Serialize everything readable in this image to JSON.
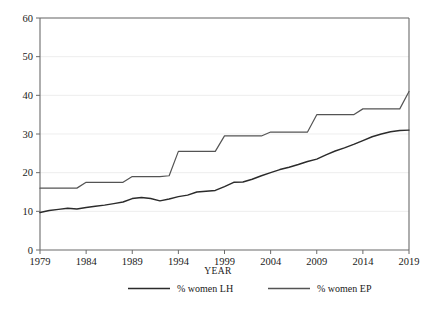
{
  "chart_data": {
    "type": "line",
    "title": "",
    "xlabel": "YEAR",
    "ylabel": "",
    "xlim": [
      1979,
      2019
    ],
    "ylim": [
      0,
      60
    ],
    "grid": true,
    "legend_position": "bottom",
    "x_ticks": [
      "1979",
      "1984",
      "1989",
      "1994",
      "1999",
      "2004",
      "2009",
      "2014",
      "2019"
    ],
    "y_ticks": [
      "0",
      "10",
      "20",
      "30",
      "40",
      "50",
      "60"
    ],
    "x": [
      1979,
      1980,
      1981,
      1982,
      1983,
      1984,
      1985,
      1986,
      1987,
      1988,
      1989,
      1990,
      1991,
      1992,
      1993,
      1994,
      1995,
      1996,
      1997,
      1998,
      1999,
      2000,
      2001,
      2002,
      2003,
      2004,
      2005,
      2006,
      2007,
      2008,
      2009,
      2010,
      2011,
      2012,
      2013,
      2014,
      2015,
      2016,
      2017,
      2018,
      2019
    ],
    "series": [
      {
        "name": "% women LH",
        "color": "#2b2b2b",
        "values": [
          9.7,
          10.2,
          10.5,
          10.8,
          10.6,
          11.0,
          11.3,
          11.6,
          12.0,
          12.4,
          13.3,
          13.6,
          13.3,
          12.7,
          13.2,
          13.8,
          14.2,
          15.0,
          15.2,
          15.4,
          16.4,
          17.5,
          17.6,
          18.3,
          19.2,
          20.0,
          20.8,
          21.4,
          22.1,
          22.9,
          23.5,
          24.6,
          25.6,
          26.4,
          27.3,
          28.3,
          29.3,
          30.0,
          30.6,
          30.9,
          31.0
        ]
      },
      {
        "name": "% women EP",
        "color": "#545454",
        "values": [
          16.0,
          16.0,
          16.0,
          16.0,
          16.0,
          17.5,
          17.5,
          17.5,
          17.5,
          17.5,
          19.0,
          19.0,
          19.0,
          19.0,
          19.2,
          25.5,
          25.5,
          25.5,
          25.5,
          25.5,
          29.5,
          29.5,
          29.5,
          29.5,
          29.5,
          30.5,
          30.5,
          30.5,
          30.5,
          30.5,
          35.0,
          35.0,
          35.0,
          35.0,
          35.0,
          36.5,
          36.5,
          36.5,
          36.5,
          36.5,
          41.0
        ]
      }
    ]
  },
  "legend": {
    "items": [
      {
        "label": "% women LH",
        "color": "#2b2b2b"
      },
      {
        "label": "% women EP",
        "color": "#545454"
      }
    ]
  }
}
